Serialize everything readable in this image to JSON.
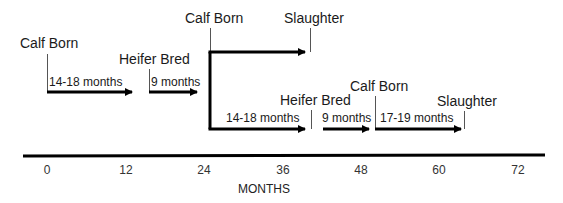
{
  "diagram": {
    "type": "timeline",
    "events": {
      "calf_born_1": "Calf Born",
      "heifer_bred_1": "Heifer Bred",
      "calf_born_2": "Calf Born",
      "slaughter_1": "Slaughter",
      "heifer_bred_2": "Heifer Bred",
      "calf_born_3": "Calf Born",
      "slaughter_2": "Slaughter"
    },
    "durations": {
      "d1": "14-18 months",
      "d2": "9 months",
      "d3": "14-18 months",
      "d4": "9 months",
      "d5": "17-19 months"
    },
    "axis": {
      "title": "MONTHS",
      "ticks": [
        "0",
        "12",
        "24",
        "36",
        "48",
        "60",
        "72"
      ]
    },
    "colors": {
      "line": "#000000",
      "leader": "#555555",
      "text": "#1a1a1a"
    }
  }
}
